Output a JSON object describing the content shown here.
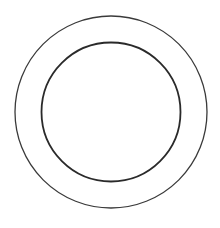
{
  "diagram": {
    "type": "concentric-circles",
    "background": "#ffffff",
    "circles": [
      {
        "name": "outer",
        "cx": 111,
        "cy": 112,
        "r": 96,
        "stroke": "#3a3a3a",
        "stroke_width": 1.3
      },
      {
        "name": "inner",
        "cx": 111,
        "cy": 112,
        "r": 69.5,
        "stroke": "#2a2a2a",
        "stroke_width": 1.8
      }
    ]
  }
}
